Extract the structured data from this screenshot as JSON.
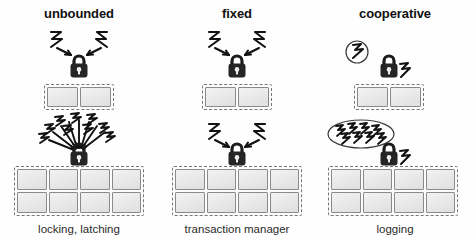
{
  "figure": {
    "background_color": "#ffffff",
    "ink_color": "#1a1a1a"
  },
  "columns": [
    {
      "id": "unbounded",
      "header": "unbounded",
      "caption": "locking, latching",
      "rows": [
        {
          "id": "unbounded-top",
          "core_count": 2,
          "core_layout": "2x1",
          "contention_icon": "bolt-pair-icon",
          "contention_count": 2,
          "lock_icon": "padlock-icon"
        },
        {
          "id": "unbounded-bottom",
          "core_count": 8,
          "core_layout": "4x2",
          "contention_icon": "bolt-cluster-icon",
          "contention_count": 8,
          "lock_icon": "padlock-icon"
        }
      ]
    },
    {
      "id": "fixed",
      "header": "fixed",
      "caption": "transaction manager",
      "rows": [
        {
          "id": "fixed-top",
          "core_count": 2,
          "core_layout": "2x1",
          "contention_icon": "bolt-pair-icon",
          "contention_count": 2,
          "lock_icon": "padlock-icon"
        },
        {
          "id": "fixed-bottom",
          "core_count": 8,
          "core_layout": "4x2",
          "contention_icon": "bolt-pair-icon",
          "contention_count": 2,
          "lock_icon": "padlock-icon"
        }
      ]
    },
    {
      "id": "cooperative",
      "header": "cooperative",
      "caption": "logging",
      "rows": [
        {
          "id": "cooperative-top",
          "core_count": 2,
          "core_layout": "2x1",
          "contention_icon": "bolt-bubble-icon",
          "contention_count": 1,
          "lock_icon": "padlock-icon",
          "lock_emission_icon": "bolt-side-icon"
        },
        {
          "id": "cooperative-bottom",
          "core_count": 8,
          "core_layout": "4x2",
          "contention_icon": "bolt-ellipse-icon",
          "contention_count": 8,
          "lock_icon": "padlock-icon",
          "lock_emission_icon": "bolt-side-icon"
        }
      ]
    }
  ],
  "legend": {
    "core_cell_label": "core",
    "lock_label": "lock"
  }
}
